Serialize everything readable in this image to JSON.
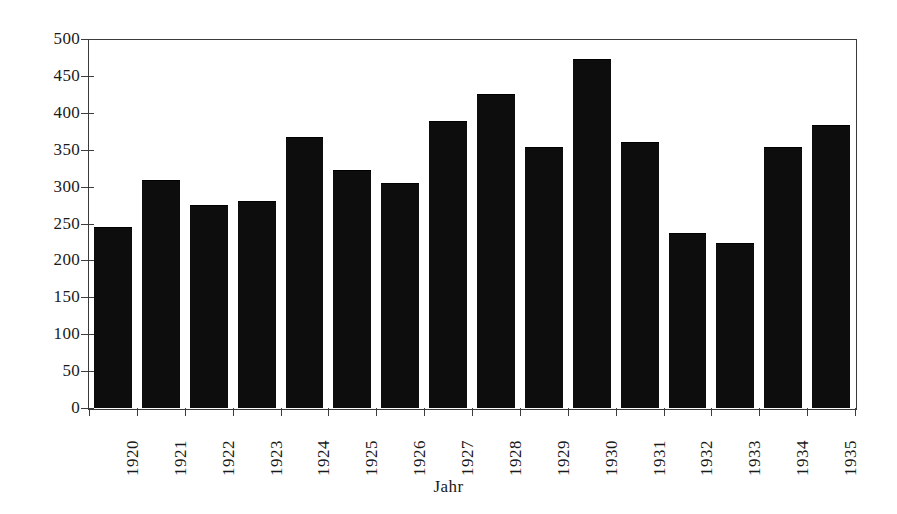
{
  "chart_data": {
    "type": "bar",
    "title": "",
    "xlabel": "Jahr",
    "ylabel": "",
    "categories": [
      "1920",
      "1921",
      "1922",
      "1923",
      "1924",
      "1925",
      "1926",
      "1927",
      "1928",
      "1929",
      "1930",
      "1931",
      "1932",
      "1933",
      "1934",
      "1935"
    ],
    "values": [
      244,
      308,
      274,
      279,
      366,
      321,
      303,
      388,
      424,
      353,
      472,
      359,
      236,
      222,
      352,
      382
    ],
    "ylim": [
      0,
      500
    ],
    "ytick_labels": [
      "500",
      "450",
      "400",
      "350",
      "300",
      "250",
      "200",
      "150",
      "100",
      "50",
      "0"
    ],
    "ytick_values": [
      500,
      450,
      400,
      350,
      300,
      250,
      200,
      150,
      100,
      50,
      0
    ],
    "grid": false,
    "legend": null,
    "bar_color": "#0d0d0d",
    "axis_color": "#3a3a3a",
    "background_color": "#ffffff"
  }
}
